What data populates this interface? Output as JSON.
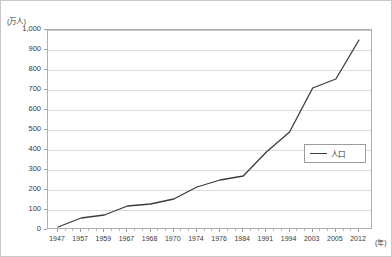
{
  "chart_data": {
    "type": "line",
    "title": "",
    "subtitle": "",
    "ylabel": "(万人)",
    "xlabel": "(年)",
    "ylim": [
      0,
      1000
    ],
    "ytick_labels": [
      "1,000",
      "900",
      "800",
      "700",
      "600",
      "500",
      "400",
      "300",
      "200",
      "100",
      "0"
    ],
    "ytick_values": [
      1000,
      900,
      800,
      700,
      600,
      500,
      400,
      300,
      200,
      100,
      0
    ],
    "grid": true,
    "legend_position": "center-right",
    "categories": [
      "1947",
      "1957",
      "1959",
      "1967",
      "1968",
      "1970",
      "1974",
      "1976",
      "1984",
      "1991",
      "1994",
      "2003",
      "2005",
      "2012"
    ],
    "series": [
      {
        "name": "人口",
        "color": "#3c3c3c",
        "values": [
          15,
          60,
          75,
          120,
          130,
          155,
          215,
          250,
          270,
          390,
          490,
          710,
          755,
          950
        ]
      }
    ]
  },
  "legend": {
    "entries": [
      {
        "label": "人口",
        "swatch": "line-swatch"
      }
    ]
  },
  "axes": {
    "y_unit_caption": "(万人)",
    "x_unit_caption": "(年)"
  }
}
